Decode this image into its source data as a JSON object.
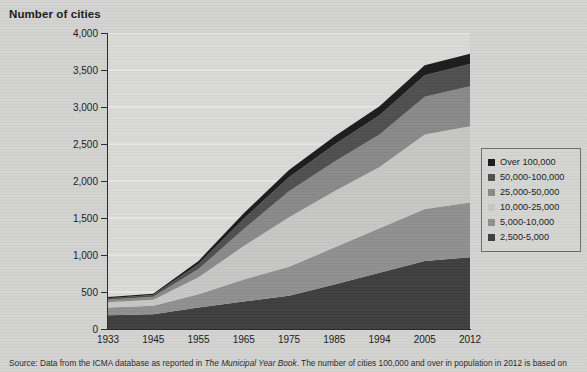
{
  "title": "Number of cities",
  "caption_prefix": "Source: Data from the ICMA database as reported in ",
  "caption_italic": "The Municipal Year Book",
  "caption_suffix": ". The number of cities 100,000 and over in population in 2012 is based on",
  "colors": {
    "over_100000": "#1c1c1c",
    "50000_100000": "#4f4f4f",
    "25000_50000": "#898989",
    "10000_25000": "#c6c6c4",
    "5000_10000": "#8f8f8f",
    "2500_5000": "#3e3e3e",
    "plot_background": "#d9d9d7",
    "page_background": "#d2d2d0",
    "axis": "#2b2b2b",
    "gridline": "#f2f2f0"
  },
  "legend": {
    "items": [
      {
        "label": "Over 100,000",
        "color": "#1c1c1c"
      },
      {
        "label": "50,000-100,000",
        "color": "#4f4f4f"
      },
      {
        "label": "25,000-50,000",
        "color": "#898989"
      },
      {
        "label": "10,000-25,000",
        "color": "#c6c6c4"
      },
      {
        "label": "5,000-10,000",
        "color": "#8f8f8f"
      },
      {
        "label": "2,500-5,000",
        "color": "#3e3e3e"
      }
    ]
  },
  "chart_data": {
    "type": "area",
    "title": "Number of cities",
    "xlabel": "",
    "ylabel": "Number of cities",
    "ylim": [
      0,
      4000
    ],
    "ytick_step": 500,
    "ytick_labels": [
      "0",
      "500",
      "1,000",
      "1,500",
      "2,000",
      "2,500",
      "3,000",
      "3,500",
      "4,000"
    ],
    "ytick_values": [
      0,
      500,
      1000,
      1500,
      2000,
      2500,
      3000,
      3500,
      4000
    ],
    "grid": true,
    "grid_axis": "y",
    "legend_position": "right",
    "stacked": true,
    "stack_order_bottom_to_top": [
      "2,500-5,000",
      "5,000-10,000",
      "10,000-25,000",
      "25,000-50,000",
      "50,000-100,000",
      "Over 100,000"
    ],
    "categories": [
      1933,
      1945,
      1955,
      1965,
      1975,
      1985,
      1994,
      2005,
      2012
    ],
    "x": [
      "1933",
      "1945",
      "1955",
      "1965",
      "1975",
      "1985",
      "1994",
      "2005",
      "2012"
    ],
    "series": [
      {
        "name": "2,500-5,000",
        "color": "#3e3e3e",
        "values": [
          185,
          200,
          290,
          370,
          450,
          600,
          760,
          920,
          970
        ]
      },
      {
        "name": "5,000-10,000",
        "color": "#8f8f8f",
        "values": [
          105,
          115,
          180,
          300,
          390,
          500,
          600,
          700,
          740
        ]
      },
      {
        "name": "10,000-25,000",
        "color": "#c6c6c4",
        "values": [
          70,
          80,
          230,
          450,
          670,
          760,
          830,
          1010,
          1030
        ]
      },
      {
        "name": "25,000-50,000",
        "color": "#898989",
        "values": [
          35,
          40,
          110,
          230,
          350,
          400,
          440,
          510,
          540
        ]
      },
      {
        "name": "50,000-100,000",
        "color": "#4f4f4f",
        "values": [
          22,
          25,
          70,
          140,
          190,
          230,
          260,
          290,
          300
        ]
      },
      {
        "name": "Over 100,000",
        "color": "#1c1c1c",
        "values": [
          15,
          18,
          40,
          75,
          100,
          110,
          120,
          135,
          140
        ]
      }
    ],
    "totals": [
      432,
      478,
      920,
      1565,
      2150,
      2600,
      3010,
      3565,
      3720
    ]
  }
}
